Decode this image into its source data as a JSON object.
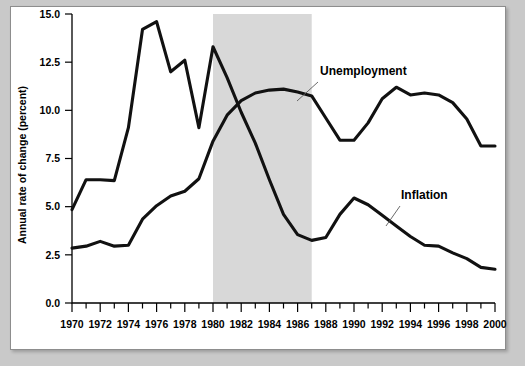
{
  "figure": {
    "background_color": "#c9c9c9",
    "panel_color": "#ffffff",
    "border_color": "#8d8d8d"
  },
  "chart_data": {
    "type": "line",
    "title": "",
    "xlabel": "",
    "ylabel": "Annual rate of change (percent)",
    "xlim": [
      1970,
      2000
    ],
    "ylim": [
      0.0,
      15.0
    ],
    "grid": false,
    "legend_position": "inline-annotation",
    "x_tick_labels": [
      "1970",
      "1972",
      "1974",
      "1976",
      "1978",
      "1980",
      "1982",
      "1984",
      "1986",
      "1988",
      "1990",
      "1992",
      "1994",
      "1996",
      "1998",
      "2000"
    ],
    "x_tick_values": [
      1970,
      1972,
      1974,
      1976,
      1978,
      1980,
      1982,
      1984,
      1986,
      1988,
      1990,
      1992,
      1994,
      1996,
      1998,
      2000
    ],
    "x_minor_tick_values": [
      1971,
      1973,
      1975,
      1977,
      1979,
      1981,
      1983,
      1985,
      1987,
      1989,
      1991,
      1993,
      1995,
      1997,
      1999
    ],
    "y_tick_labels": [
      "0.0",
      "2.5",
      "5.0",
      "7.5",
      "10.0",
      "12.5",
      "15.0"
    ],
    "y_tick_values": [
      0.0,
      2.5,
      5.0,
      7.5,
      10.0,
      12.5,
      15.0
    ],
    "x": [
      1970,
      1971,
      1972,
      1973,
      1974,
      1975,
      1976,
      1977,
      1978,
      1979,
      1980,
      1981,
      1982,
      1983,
      1984,
      1985,
      1986,
      1987,
      1988,
      1989,
      1990,
      1991,
      1992,
      1993,
      1994,
      1995,
      1996,
      1997,
      1998,
      1999,
      2000
    ],
    "series": [
      {
        "name": "Unemployment",
        "color": "#111111",
        "values": [
          4.85,
          6.4,
          6.4,
          6.35,
          9.1,
          14.2,
          14.6,
          12.0,
          12.6,
          9.1,
          13.3,
          11.7,
          9.9,
          8.3,
          6.4,
          4.6,
          3.55,
          3.25,
          3.4,
          4.6,
          5.45,
          5.1,
          4.55,
          4.0,
          3.45,
          3.0,
          2.95,
          2.6,
          2.3,
          1.85,
          1.75
        ],
        "label_annotation": "Unemployment"
      },
      {
        "name": "Inflation",
        "color": "#111111",
        "values": [
          2.85,
          2.95,
          3.2,
          2.95,
          3.0,
          4.35,
          5.05,
          5.55,
          5.8,
          6.45,
          8.4,
          9.75,
          10.5,
          10.9,
          11.05,
          11.1,
          10.95,
          10.75,
          9.6,
          8.45,
          8.45,
          9.35,
          10.6,
          11.2,
          10.8,
          10.9,
          10.8,
          10.4,
          9.55,
          8.15,
          8.15
        ],
        "label_annotation": "Inflation"
      }
    ],
    "annotations": [
      {
        "name": "unemployment-label",
        "text": "Unemployment",
        "text_x": 320,
        "text_y": 75,
        "leader_from_x": 318,
        "leader_from_y": 82,
        "leader_to_x": 297,
        "leader_to_y": 101
      },
      {
        "name": "inflation-label",
        "text": "Inflation",
        "text_x": 401,
        "text_y": 199,
        "leader_from_x": 400,
        "leader_from_y": 206,
        "leader_to_x": 386,
        "leader_to_y": 226
      }
    ],
    "shaded_region": {
      "name": "recession-band",
      "start": 1980,
      "end": 1987,
      "color": "#d8d8d8"
    }
  }
}
